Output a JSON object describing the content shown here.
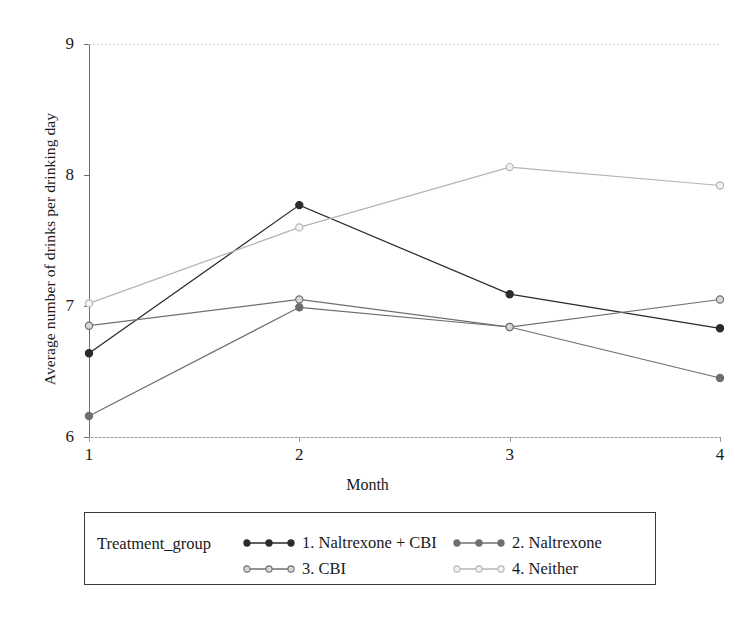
{
  "chart_data": {
    "type": "line",
    "title": "",
    "xlabel": "Month",
    "ylabel": "Average number of drinks per drinking day",
    "x": [
      1,
      2,
      3,
      4
    ],
    "xtick_labels": [
      "1",
      "2",
      "3",
      "4"
    ],
    "ytick_labels": [
      "6",
      "7",
      "8",
      "9"
    ],
    "yticks": [
      6,
      7,
      8,
      9
    ],
    "xlim": [
      1,
      4
    ],
    "ylim": [
      6,
      9
    ],
    "grid": false,
    "legend_position": "bottom",
    "legend_title": "Treatment_group",
    "marker": "circle",
    "series": [
      {
        "name": "1. Naltrexone + CBI",
        "color": "#2b2b2b",
        "marker_fill": "#2b2b2b",
        "values": [
          6.64,
          7.77,
          7.09,
          6.83
        ]
      },
      {
        "name": "2. Naltrexone",
        "color": "#6e6e6e",
        "marker_fill": "#6e6e6e",
        "values": [
          6.16,
          6.99,
          6.84,
          6.45
        ]
      },
      {
        "name": "3. CBI",
        "color": "#707070",
        "marker_fill": "#d8d8d8",
        "values": [
          6.85,
          7.05,
          6.84,
          7.05
        ]
      },
      {
        "name": "4. Neither",
        "color": "#b4b4b4",
        "marker_fill": "#f2f2f2",
        "values": [
          7.02,
          7.6,
          8.06,
          7.92
        ]
      }
    ]
  },
  "axes": {
    "y_title": "Average number of drinks per drinking day",
    "x_title": "Month"
  },
  "legend": {
    "title": "Treatment_group",
    "entries": [
      {
        "label": "1. Naltrexone + CBI"
      },
      {
        "label": "2. Naltrexone"
      },
      {
        "label": "3. CBI"
      },
      {
        "label": "4. Neither"
      }
    ]
  }
}
